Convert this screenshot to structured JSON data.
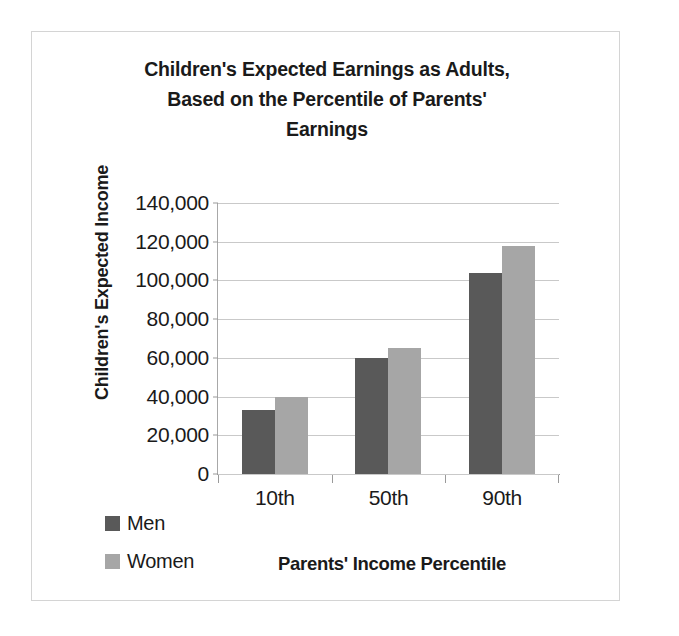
{
  "chart_data": {
    "type": "bar",
    "title": "Children's Expected Earnings as Adults, Based on the Percentile of Parents' Earnings",
    "title_lines": [
      "Children's Expected Earnings as Adults,",
      "Based on the Percentile of Parents'",
      "Earnings"
    ],
    "xlabel": "Parents' Income Percentile",
    "ylabel": "Children's Expected Income",
    "categories": [
      "10th",
      "50th",
      "90th"
    ],
    "series": [
      {
        "name": "Men",
        "color": "#595959",
        "values": [
          33000,
          60000,
          104000
        ]
      },
      {
        "name": "Women",
        "color": "#a6a6a6",
        "values": [
          40000,
          65000,
          118000
        ]
      }
    ],
    "ylim": [
      0,
      140000
    ],
    "ytick_values": [
      0,
      20000,
      40000,
      60000,
      80000,
      100000,
      120000,
      140000
    ],
    "ytick_labels": [
      "0",
      "20,000",
      "40,000",
      "60,000",
      "80,000",
      "100,000",
      "120,000",
      "140,000"
    ],
    "grid": true,
    "grid_axis": "y",
    "legend_position": "left-bottom",
    "legend_entries": [
      "Men",
      "Women"
    ],
    "bar_gap": "none",
    "data_labels": false
  },
  "frame": {
    "border_color": "#d4d4d4",
    "background": "#ffffff"
  }
}
